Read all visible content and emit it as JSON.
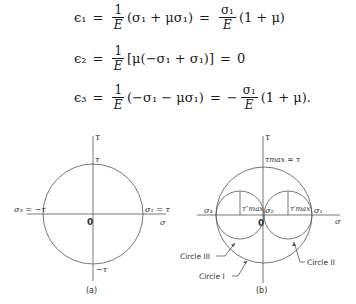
{
  "equations": [
    {
      "lhs": "ϵ₁",
      "frac1": {
        "num": "1",
        "den": "E"
      },
      "mid": "(σ₁ + μσ₁)",
      "frac2": {
        "num": "σ₁",
        "den": "E"
      },
      "rhs": "(1 + μ)",
      "eq_sign": "=",
      "sign": ""
    },
    {
      "lhs": "ϵ₂",
      "frac1": {
        "num": "1",
        "den": "E"
      },
      "mid": "[μ(−σ₁ + σ₁)]",
      "result": "0",
      "eq_sign": "="
    },
    {
      "lhs": "ϵ₃",
      "frac1": {
        "num": "1",
        "den": "E"
      },
      "mid": "(−σ₁ − μσ₁)",
      "frac2": {
        "num": "σ₁",
        "den": "E"
      },
      "rhs": "(1 + μ).",
      "eq_sign": "=",
      "sign": "−"
    }
  ],
  "figure_a": {
    "caption": "(a)",
    "axis_v_label": "τ",
    "axis_h_label": "σ",
    "origin_label": "0",
    "top_label": "τ",
    "bottom_label": "−τ",
    "left_label": "σ₃ = −τ",
    "right_label": "σ₁ = τ"
  },
  "figure_b": {
    "caption": "(b)",
    "axis_v_label": "τ",
    "axis_h_label": "σ",
    "origin_label": "0",
    "top_label": "τmax = τ",
    "sigma3_label": "σ₃",
    "sigma2_label": "σ₂",
    "sigma1_label": "σ₁",
    "tau_max_dd_label": "τ″max",
    "tau_max_d_label": "τ′max",
    "circle1_label": "Circle I",
    "circle2_label": "Circle II",
    "circle3_label": "Circle III"
  }
}
